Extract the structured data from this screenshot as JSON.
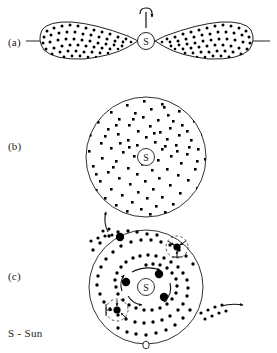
{
  "figure": {
    "type": "scientific-diagram",
    "background_color": "#ffffff",
    "ink_color": "#111111"
  },
  "panels": [
    {
      "id": "a",
      "label": "(a)",
      "description": "rotating flattened nebula with two tapered lobes and central Sun",
      "sun_label": "S",
      "has_rotation_axis": true,
      "rotation_symbol": "spin-axis-curved-arrow",
      "lobe_count": 2
    },
    {
      "id": "b",
      "label": "(b)",
      "description": "circular disk of uniformly scattered dust grains around the Sun",
      "sun_label": "S",
      "particle_count": 150
    },
    {
      "id": "c",
      "label": "(c)",
      "description": "spiral of planetesimals accreting into planets with escaping material",
      "sun_label": "S",
      "planetesimal_count": 3,
      "forming_planet_count": 2,
      "escape_arrow_count": 2
    }
  ],
  "legend": {
    "text": "S - Sun",
    "symbol": "S",
    "meaning": "Sun"
  },
  "colors": {
    "ink": "#111111",
    "stipple": "#000000",
    "outline": "#333333",
    "background": "#ffffff"
  }
}
